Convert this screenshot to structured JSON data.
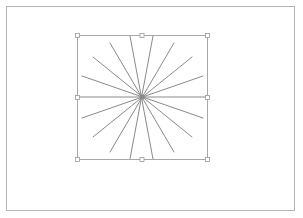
{
  "canvas": {
    "background": "#ffffff",
    "frame_color": "#b4b4b4",
    "ray_color": "#8a8a8a",
    "box_color": "#a8a8a8",
    "handle_color": "#9a9a9a"
  },
  "selection": {
    "shape": "starburst",
    "ray_count": 16,
    "center": [
      142,
      97
    ],
    "bounds": {
      "left": 77,
      "top": 35,
      "right": 207,
      "bottom": 159
    },
    "handles": [
      "top-left",
      "top-center",
      "top-right",
      "middle-left",
      "middle-right",
      "bottom-left",
      "bottom-center",
      "bottom-right"
    ]
  }
}
